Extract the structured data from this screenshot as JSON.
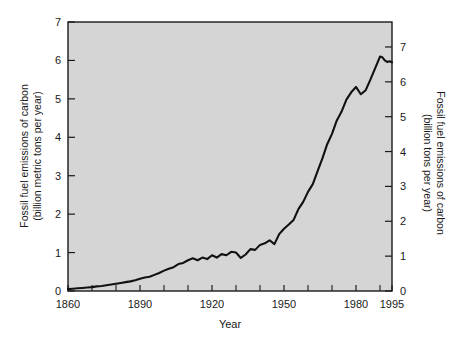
{
  "chart_data": {
    "type": "line",
    "title": "",
    "xlabel": "Year",
    "ylabel": "Fossil fuel emissions of carbon\n(billion metric tons per year)",
    "ylabel_right": "Fossil fuel emissions of carbon\n(billion tons per year)",
    "xlim": [
      1860,
      1995
    ],
    "ylim": [
      0,
      7
    ],
    "ylim_right": [
      0,
      7
    ],
    "grid": false,
    "legend": "none",
    "xticks": [
      1860,
      1890,
      1920,
      1950,
      1980,
      1995
    ],
    "xtick_labels": [
      "1860",
      "1890",
      "1920",
      "1950",
      "1980",
      "1995"
    ],
    "xticks_minor": [
      1870,
      1880,
      1900,
      1910,
      1930,
      1940,
      1960,
      1970,
      1990
    ],
    "yticks": [
      0,
      1,
      2,
      3,
      4,
      5,
      6,
      7
    ],
    "ytick_labels": [
      "0",
      "1",
      "2",
      "3",
      "4",
      "5",
      "6",
      "7"
    ],
    "yticks_right": [
      0,
      1,
      2,
      3,
      4,
      5,
      6,
      7
    ],
    "ytick_labels_right": [
      "0",
      "1",
      "2",
      "3",
      "4",
      "5",
      "6",
      "7"
    ],
    "right_axis_scale_factor": 1.1023,
    "series": [
      {
        "name": "Global fossil fuel carbon emissions",
        "units": "billion metric tons of carbon per year",
        "x": [
          1860,
          1862,
          1864,
          1866,
          1868,
          1870,
          1872,
          1874,
          1876,
          1878,
          1880,
          1882,
          1884,
          1886,
          1888,
          1890,
          1892,
          1894,
          1896,
          1898,
          1900,
          1902,
          1904,
          1906,
          1908,
          1910,
          1912,
          1914,
          1916,
          1918,
          1920,
          1922,
          1924,
          1926,
          1928,
          1930,
          1932,
          1934,
          1936,
          1938,
          1940,
          1942,
          1944,
          1946,
          1948,
          1950,
          1952,
          1954,
          1956,
          1958,
          1960,
          1962,
          1964,
          1966,
          1968,
          1970,
          1972,
          1974,
          1976,
          1978,
          1980,
          1982,
          1984,
          1986,
          1988,
          1990,
          1991,
          1992,
          1993,
          1994,
          1995
        ],
        "values": [
          0.05,
          0.06,
          0.07,
          0.08,
          0.09,
          0.1,
          0.12,
          0.13,
          0.15,
          0.17,
          0.19,
          0.21,
          0.23,
          0.25,
          0.28,
          0.32,
          0.35,
          0.37,
          0.42,
          0.47,
          0.53,
          0.58,
          0.62,
          0.7,
          0.73,
          0.8,
          0.85,
          0.8,
          0.87,
          0.83,
          0.93,
          0.87,
          0.96,
          0.93,
          1.02,
          1.0,
          0.86,
          0.95,
          1.09,
          1.07,
          1.2,
          1.24,
          1.32,
          1.22,
          1.48,
          1.62,
          1.73,
          1.85,
          2.13,
          2.32,
          2.58,
          2.78,
          3.12,
          3.45,
          3.82,
          4.09,
          4.44,
          4.67,
          4.98,
          5.17,
          5.31,
          5.12,
          5.22,
          5.5,
          5.8,
          6.1,
          6.08,
          6.0,
          5.96,
          5.98,
          5.95
        ]
      }
    ],
    "annotations": []
  },
  "axes": {
    "left_title_line1": "Fossil fuel emissions of carbon",
    "left_title_line2": "(billion metric tons per year)",
    "right_title_line1": "Fossil fuel emissions of carbon",
    "right_title_line2": "(billion tons per year)",
    "x_title": "Year"
  },
  "style": {
    "plot_background": "#d5d5d5",
    "page_background": "#ffffff",
    "line_color": "#111111",
    "axis_color": "#1a1a1a",
    "text_color": "#1a1a1a"
  }
}
